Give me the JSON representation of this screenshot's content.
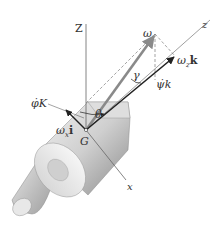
{
  "diagram": {
    "labels": {
      "Z_axis": "Z",
      "z_axis": "z",
      "x_axis": "x",
      "omega": "ω",
      "omega_z_k": "ω",
      "omega_z_k_sub": "z",
      "omega_z_k_unit": "k",
      "psi_dot_k": "ψ̇k",
      "phi_dot_K": "φ̇K",
      "theta": "θ",
      "gamma": "γ",
      "omega_x_i": "ω",
      "omega_x_i_sub": "x",
      "omega_x_i_unit": "i",
      "G": "G"
    },
    "colors": {
      "line": "#555555",
      "vector": "#222222",
      "body_light": "#e6e6e6",
      "body_dark": "#9a9a9a",
      "omega_vector": "#8a8a8a"
    }
  }
}
